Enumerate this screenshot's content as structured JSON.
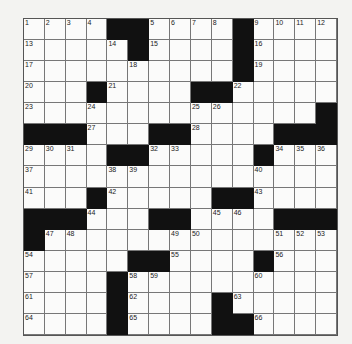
{
  "puzzle": {
    "rows": 15,
    "cols": 15,
    "colors": {
      "black": "#111111",
      "white": "#fbfbfa",
      "line": "#777777"
    },
    "grid": [
      "....##....#....",
      ".....#....#....",
      "..........#....",
      "...#....##.....",
      "..............#",
      "###...##....###",
      "....##.....#...",
      "...............",
      "...#.....##....",
      "###...##....###",
      "#..............",
      ".....##....#...",
      "....#..........",
      "....#....#.....",
      "....#....##...."
    ],
    "numbers": [
      [
        1,
        1,
        1
      ],
      [
        1,
        2,
        2
      ],
      [
        1,
        3,
        3
      ],
      [
        1,
        4,
        4
      ],
      [
        1,
        7,
        5
      ],
      [
        1,
        8,
        6
      ],
      [
        1,
        9,
        7
      ],
      [
        1,
        10,
        8
      ],
      [
        1,
        12,
        9
      ],
      [
        1,
        13,
        10
      ],
      [
        1,
        14,
        11
      ],
      [
        1,
        15,
        12
      ],
      [
        2,
        1,
        13
      ],
      [
        2,
        5,
        14
      ],
      [
        2,
        7,
        15
      ],
      [
        2,
        12,
        16
      ],
      [
        3,
        1,
        17
      ],
      [
        3,
        6,
        18
      ],
      [
        3,
        12,
        19
      ],
      [
        4,
        1,
        20
      ],
      [
        4,
        5,
        21
      ],
      [
        4,
        11,
        22
      ],
      [
        5,
        1,
        23
      ],
      [
        5,
        4,
        24
      ],
      [
        5,
        9,
        25
      ],
      [
        5,
        10,
        26
      ],
      [
        6,
        4,
        27
      ],
      [
        6,
        9,
        28
      ],
      [
        7,
        1,
        29
      ],
      [
        7,
        2,
        30
      ],
      [
        7,
        3,
        31
      ],
      [
        7,
        7,
        32
      ],
      [
        7,
        8,
        33
      ],
      [
        7,
        13,
        34
      ],
      [
        7,
        14,
        35
      ],
      [
        7,
        15,
        36
      ],
      [
        8,
        1,
        37
      ],
      [
        8,
        5,
        38
      ],
      [
        8,
        6,
        39
      ],
      [
        8,
        12,
        40
      ],
      [
        9,
        1,
        41
      ],
      [
        9,
        5,
        42
      ],
      [
        9,
        12,
        43
      ],
      [
        10,
        4,
        44
      ],
      [
        10,
        10,
        45
      ],
      [
        10,
        11,
        46
      ],
      [
        11,
        2,
        47
      ],
      [
        11,
        3,
        48
      ],
      [
        11,
        8,
        49
      ],
      [
        11,
        9,
        50
      ],
      [
        11,
        13,
        51
      ],
      [
        11,
        14,
        52
      ],
      [
        11,
        15,
        53
      ],
      [
        12,
        1,
        54
      ],
      [
        12,
        8,
        55
      ],
      [
        12,
        13,
        56
      ],
      [
        13,
        1,
        57
      ],
      [
        13,
        6,
        58
      ],
      [
        13,
        7,
        59
      ],
      [
        13,
        12,
        60
      ],
      [
        14,
        1,
        61
      ],
      [
        14,
        6,
        62
      ],
      [
        14,
        11,
        63
      ],
      [
        15,
        1,
        64
      ],
      [
        15,
        6,
        65
      ],
      [
        15,
        12,
        66
      ]
    ]
  }
}
